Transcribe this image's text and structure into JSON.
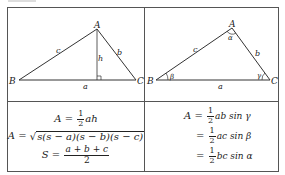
{
  "figure": {
    "left_diagram": {
      "type": "triangle-with-altitude",
      "vertices": {
        "A": "A",
        "B": "B",
        "C": "C"
      },
      "sides": {
        "a": "a",
        "b": "b",
        "c": "c"
      },
      "altitude_label": "h"
    },
    "right_diagram": {
      "type": "triangle-with-angles",
      "vertices": {
        "A": "A",
        "B": "B",
        "C": "C"
      },
      "sides": {
        "a": "a",
        "b": "b",
        "c": "c"
      },
      "angles": {
        "alpha": "α",
        "beta": "β",
        "gamma": "γ"
      }
    },
    "left_formulas": {
      "f1_lhs": "A =",
      "f1_frac_num": "1",
      "f1_frac_den": "2",
      "f1_rhs": "ah",
      "f2_lhs": "A =",
      "f2_radicand": "s(s − a)(s − b)(s − c)",
      "f3_lhs": "S =",
      "f3_num": "a + b + c",
      "f3_den": "2"
    },
    "right_formulas": {
      "f1_lhs": "A =",
      "f1_num": "1",
      "f1_den": "2",
      "f1_rhs": "ab sin γ",
      "f2_lhs": "=",
      "f2_num": "1",
      "f2_den": "2",
      "f2_rhs": "ac sin β",
      "f3_lhs": "=",
      "f3_num": "1",
      "f3_den": "2",
      "f3_rhs": "bc sin α"
    }
  }
}
